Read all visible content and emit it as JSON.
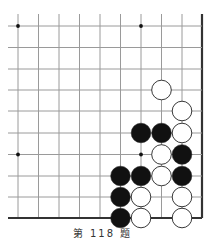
{
  "diagram": {
    "type": "go-board-fragment",
    "columns": 10,
    "rows": 10,
    "edges": [
      "right",
      "bottom"
    ],
    "grid": {
      "x_positions": [
        18,
        38.5,
        59,
        79.5,
        100,
        120.5,
        141,
        161.5,
        182,
        202
      ],
      "y_positions": [
        26,
        47.5,
        69,
        90,
        111,
        133,
        154.5,
        176,
        197,
        218
      ],
      "line_color": "#9a9a9a",
      "edge_color": "#333333"
    },
    "star_points": [
      {
        "col": 0,
        "row": 0
      },
      {
        "col": 6,
        "row": 0
      },
      {
        "col": 0,
        "row": 6
      },
      {
        "col": 6,
        "row": 6
      }
    ],
    "stones": [
      {
        "color": "white",
        "col": 7,
        "row": 3
      },
      {
        "color": "white",
        "col": 8,
        "row": 4
      },
      {
        "color": "black",
        "col": 6,
        "row": 5
      },
      {
        "color": "black",
        "col": 7,
        "row": 5
      },
      {
        "color": "white",
        "col": 8,
        "row": 5
      },
      {
        "color": "white",
        "col": 7,
        "row": 6
      },
      {
        "color": "black",
        "col": 8,
        "row": 6
      },
      {
        "color": "black",
        "col": 5,
        "row": 7
      },
      {
        "color": "black",
        "col": 6,
        "row": 7
      },
      {
        "color": "white",
        "col": 7,
        "row": 7
      },
      {
        "color": "black",
        "col": 8,
        "row": 7
      },
      {
        "color": "black",
        "col": 5,
        "row": 8
      },
      {
        "color": "white",
        "col": 6,
        "row": 8
      },
      {
        "color": "white",
        "col": 8,
        "row": 8
      },
      {
        "color": "black",
        "col": 5,
        "row": 9
      },
      {
        "color": "white",
        "col": 6,
        "row": 9
      },
      {
        "color": "white",
        "col": 8,
        "row": 9
      }
    ]
  },
  "caption": "第 118 题"
}
